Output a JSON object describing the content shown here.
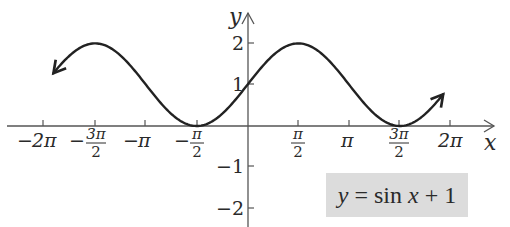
{
  "chart_data": {
    "type": "line",
    "title": "y = sin x + 1",
    "function": "sin(x) + 1",
    "xlabel": "x",
    "ylabel": "y",
    "xlim": [
      -6.283,
      6.283
    ],
    "ylim": [
      -2.2,
      2.7
    ],
    "grid": false,
    "legend": null,
    "x_ticks": [
      {
        "value": -6.2832,
        "label": "−2π"
      },
      {
        "value": -4.7124,
        "label": "−3π/2"
      },
      {
        "value": -3.1416,
        "label": "−π"
      },
      {
        "value": -1.5708,
        "label": "−π/2"
      },
      {
        "value": 1.5708,
        "label": "π/2"
      },
      {
        "value": 3.1416,
        "label": "π"
      },
      {
        "value": 4.7124,
        "label": "3π/2"
      },
      {
        "value": 6.2832,
        "label": "2π"
      }
    ],
    "y_ticks": [
      {
        "value": 2,
        "label": "2"
      },
      {
        "value": 1,
        "label": "1"
      },
      {
        "value": -1,
        "label": "−1"
      },
      {
        "value": -2,
        "label": "−2"
      }
    ],
    "series": [
      {
        "name": "y = sin x + 1",
        "x_range": [
          -6.0,
          6.05
        ],
        "points": [
          {
            "x": -6.2832,
            "y": 1
          },
          {
            "x": -4.7124,
            "y": 2
          },
          {
            "x": -3.1416,
            "y": 1
          },
          {
            "x": -1.5708,
            "y": 0
          },
          {
            "x": 0,
            "y": 1
          },
          {
            "x": 1.5708,
            "y": 2
          },
          {
            "x": 3.1416,
            "y": 1
          },
          {
            "x": 4.7124,
            "y": 0
          },
          {
            "x": 6.2832,
            "y": 1
          }
        ],
        "arrow_ends": true,
        "color": "#222222"
      }
    ],
    "annotation": {
      "text": "y = sin x + 1",
      "background": "#dcdcdc"
    }
  },
  "axes": {
    "x_label": "x",
    "y_label": "y",
    "x_tick_labels": {
      "neg_2pi": {
        "sign": "−",
        "num": "2π",
        "den": ""
      },
      "neg_3pi2": {
        "sign": "−",
        "num": "3π",
        "den": "2"
      },
      "neg_pi": {
        "sign": "−",
        "num": "π",
        "den": ""
      },
      "neg_pi2": {
        "sign": "−",
        "num": "π",
        "den": "2"
      },
      "pi2": {
        "sign": "",
        "num": "π",
        "den": "2"
      },
      "pi": {
        "sign": "",
        "num": "π",
        "den": ""
      },
      "three_pi2": {
        "sign": "",
        "num": "3π",
        "den": "2"
      },
      "two_pi": {
        "sign": "",
        "num": "2π",
        "den": ""
      }
    },
    "y_tick_labels": {
      "two": "2",
      "one": "1",
      "neg_one": "−1",
      "neg_two": "−2"
    }
  },
  "equation": {
    "lhs": "y",
    "eq": " = sin ",
    "var": "x",
    "rest": " + 1"
  },
  "style": {
    "curve_color": "#222222",
    "axis_color": "#555555",
    "box_color": "#dcdcdc"
  }
}
